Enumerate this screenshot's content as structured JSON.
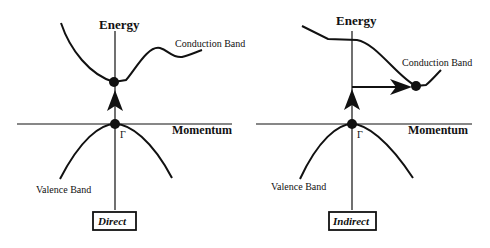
{
  "panels": [
    {
      "name": "direct",
      "axis_y_label": "Energy",
      "axis_x_label": "Momentum",
      "conduction_label": "Conduction Band",
      "valence_label": "Valence Band",
      "gamma_label": "Γ",
      "caption": "Direct"
    },
    {
      "name": "indirect",
      "axis_y_label": "Energy",
      "axis_x_label": "Momentum",
      "conduction_label": "Conduction Band",
      "valence_label": "Valence Band",
      "gamma_label": "Γ",
      "caption": "Indirect"
    }
  ],
  "colors": {
    "line": "#111111",
    "background": "#ffffff"
  }
}
